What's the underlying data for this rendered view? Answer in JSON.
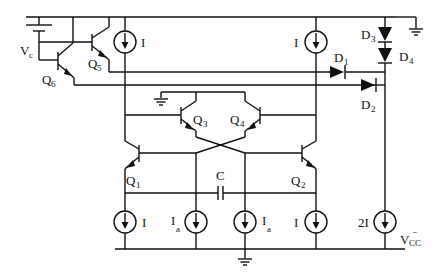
{
  "diagram": {
    "type": "circuit-schematic",
    "title": "",
    "transistors": [
      {
        "id": "Q1",
        "label": "Q",
        "sub": "1"
      },
      {
        "id": "Q2",
        "label": "Q",
        "sub": "2"
      },
      {
        "id": "Q3",
        "label": "Q",
        "sub": "3"
      },
      {
        "id": "Q4",
        "label": "Q",
        "sub": "4"
      },
      {
        "id": "Q5",
        "label": "Q",
        "sub": "5"
      },
      {
        "id": "Q6",
        "label": "Q",
        "sub": "6"
      }
    ],
    "diodes": [
      {
        "id": "D1",
        "label": "D",
        "sub": "1"
      },
      {
        "id": "D2",
        "label": "D",
        "sub": "2"
      },
      {
        "id": "D3",
        "label": "D",
        "sub": "3"
      },
      {
        "id": "D4",
        "label": "D",
        "sub": "4"
      }
    ],
    "current_sources": [
      {
        "id": "top-left",
        "label": "I",
        "sub": ""
      },
      {
        "id": "top-right",
        "label": "I",
        "sub": ""
      },
      {
        "id": "bottom-1",
        "label": "I",
        "sub": ""
      },
      {
        "id": "bottom-2",
        "label": "I",
        "sub": "a"
      },
      {
        "id": "bottom-3",
        "label": "I",
        "sub": "a"
      },
      {
        "id": "bottom-4",
        "label": "I",
        "sub": ""
      },
      {
        "id": "bias",
        "label": "2I",
        "sub": ""
      }
    ],
    "capacitor": {
      "label": "C"
    },
    "voltage_source": {
      "label": "V",
      "sub": "c"
    },
    "supply": {
      "label": "V",
      "sub": "CC",
      "sup": "−"
    }
  }
}
